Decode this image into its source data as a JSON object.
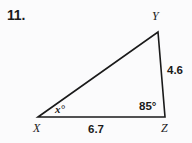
{
  "problem": {
    "number": "11."
  },
  "figure": {
    "type": "triangle",
    "vertices": [
      {
        "name": "X",
        "label": "X",
        "x": 38,
        "y": 117
      },
      {
        "name": "Y",
        "label": "Y",
        "x": 158,
        "y": 32
      },
      {
        "name": "Z",
        "label": "Z",
        "x": 165,
        "y": 117
      }
    ],
    "sides": [
      {
        "name": "YZ",
        "label": "4.6"
      },
      {
        "name": "XZ",
        "label": "6.7"
      }
    ],
    "angles": [
      {
        "name": "Z",
        "label": "85°"
      },
      {
        "name": "X",
        "label": "x°"
      }
    ],
    "stroke_color": "#1a1a1a",
    "stroke_width": 1.6,
    "background_color": "#fbfbfc"
  }
}
